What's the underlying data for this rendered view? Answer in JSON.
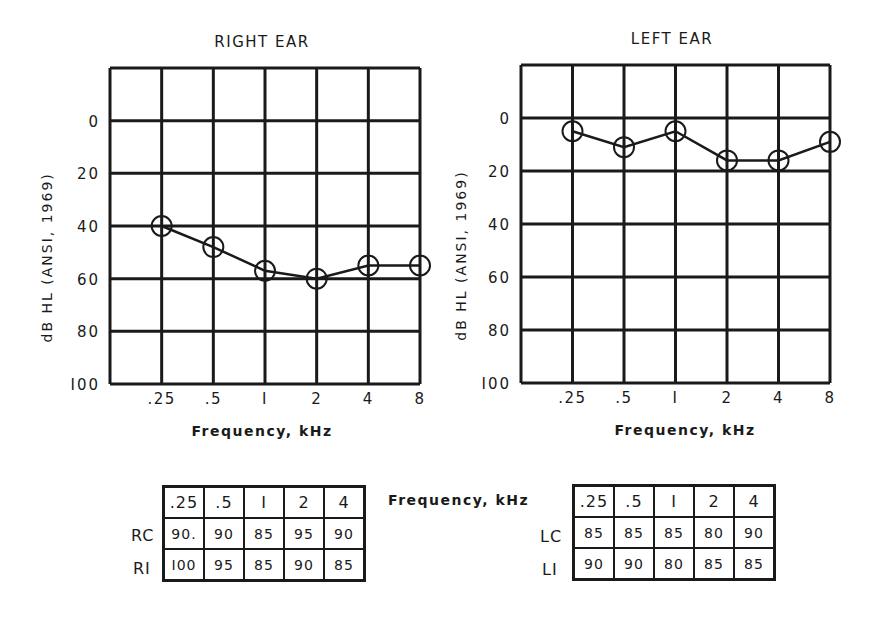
{
  "chart_data": [
    {
      "type": "line",
      "title": "RIGHT EAR",
      "xlabel": "Frequency, kHz",
      "ylabel": "dB HL (ANSI, 1969)",
      "categories": [
        ".25",
        ".5",
        "1",
        "2",
        "4",
        "8"
      ],
      "values": [
        40,
        48,
        57,
        60,
        55,
        55
      ],
      "marker": "circle",
      "y_ticks": [
        0,
        20,
        40,
        60,
        80,
        100
      ],
      "ylim": [
        -20,
        100
      ],
      "y_inverted": true,
      "grid": true
    },
    {
      "type": "line",
      "title": "LEFT EAR",
      "xlabel": "Frequency, kHz",
      "ylabel": "dB HL (ANSI, 1969)",
      "categories": [
        ".25",
        ".5",
        "1",
        "2",
        "4",
        "8"
      ],
      "values": [
        5,
        11,
        5,
        16,
        16,
        9
      ],
      "marker": "circle",
      "y_ticks": [
        0,
        20,
        40,
        60,
        80,
        100
      ],
      "ylim": [
        -20,
        100
      ],
      "y_inverted": true,
      "grid": true
    },
    {
      "type": "table",
      "title": "Right ear table",
      "columns": [
        ".25",
        ".5",
        "1",
        "2",
        "4"
      ],
      "rows": [
        {
          "label": "RC",
          "values": [
            "90.",
            "90",
            "85",
            "95",
            "90"
          ]
        },
        {
          "label": "RI",
          "values": [
            "100",
            "95",
            "85",
            "90",
            "85"
          ]
        }
      ]
    },
    {
      "type": "table",
      "title": "Left ear table",
      "columns": [
        ".25",
        ".5",
        "1",
        "2",
        "4"
      ],
      "rows": [
        {
          "label": "LC",
          "values": [
            "85",
            "85",
            "85",
            "80",
            "90"
          ]
        },
        {
          "label": "LI",
          "values": [
            "90",
            "90",
            "80",
            "85",
            "85"
          ]
        }
      ]
    }
  ],
  "tables_caption": "Frequency, kHz",
  "tick_labels": {
    "x": [
      ".25",
      ".5",
      "I",
      "2",
      "4",
      "8"
    ],
    "y": [
      "0",
      "20",
      "40",
      "60",
      "80",
      "I00"
    ]
  },
  "colors": {
    "ink": "#1a1a1a",
    "background": "#ffffff"
  }
}
